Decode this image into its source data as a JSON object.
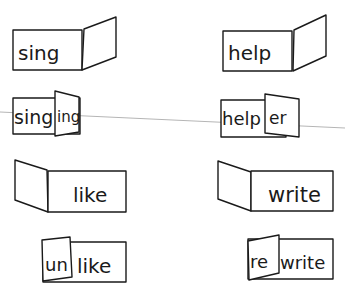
{
  "diagram": {
    "type": "word-fold-cards",
    "colors": {
      "ink": "#1a1a1a",
      "background": "#ffffff",
      "guide_line": "#b5b5b5"
    },
    "cards": [
      {
        "id": "sing-open",
        "base": "sing",
        "affix": "",
        "affix_type": "suffix",
        "state": "unfolded"
      },
      {
        "id": "sing-folded",
        "base": "sing",
        "affix": "ing",
        "affix_type": "suffix",
        "state": "folded",
        "result": "singing"
      },
      {
        "id": "help-open",
        "base": "help",
        "affix": "",
        "affix_type": "suffix",
        "state": "unfolded"
      },
      {
        "id": "help-folded",
        "base": "help",
        "affix": "er",
        "affix_type": "suffix",
        "state": "folded",
        "result": "helper"
      },
      {
        "id": "like-open",
        "base": "like",
        "affix": "",
        "affix_type": "prefix",
        "state": "unfolded"
      },
      {
        "id": "like-folded",
        "base": "like",
        "affix": "un",
        "affix_type": "prefix",
        "state": "folded",
        "result": "unlike"
      },
      {
        "id": "write-open",
        "base": "write",
        "affix": "",
        "affix_type": "prefix",
        "state": "unfolded"
      },
      {
        "id": "write-folded",
        "base": "write",
        "affix": "re",
        "affix_type": "prefix",
        "state": "folded",
        "result": "rewrite"
      }
    ]
  },
  "labels": {
    "sing": "sing",
    "sing2": "sing",
    "ing": "ing",
    "help": "help",
    "help2": "help",
    "er": "er",
    "like": "like",
    "like2": "like",
    "un": "un",
    "write": "write",
    "write2": "write",
    "re": "re"
  }
}
